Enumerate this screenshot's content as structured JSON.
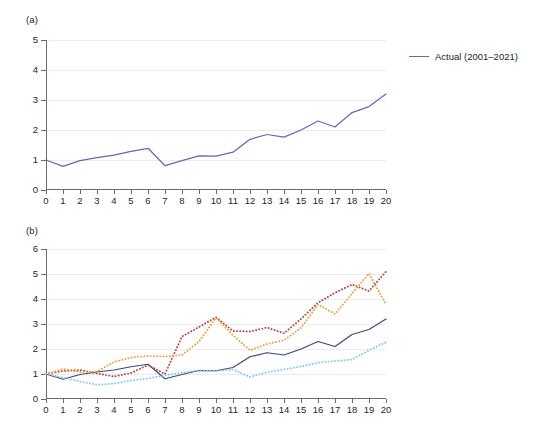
{
  "figure": {
    "panels": [
      {
        "id": "a",
        "label": "(a)",
        "ylim": [
          0,
          5
        ],
        "yticks": [
          "0",
          "1",
          "2",
          "3",
          "4",
          "5"
        ],
        "xticks": [
          "0",
          "1",
          "2",
          "3",
          "4",
          "5",
          "6",
          "7",
          "8",
          "9",
          "10",
          "11",
          "12",
          "13",
          "14",
          "15",
          "16",
          "17",
          "18",
          "19",
          "20"
        ],
        "legend": [
          {
            "name": "actual",
            "label": "Actual (2001–2021)",
            "color": "#5b6fae",
            "style": "solid"
          }
        ]
      },
      {
        "id": "b",
        "label": "(b)",
        "ylim": [
          0,
          6
        ],
        "yticks": [
          "0",
          "1",
          "2",
          "3",
          "4",
          "5",
          "6"
        ],
        "xticks": [
          "0",
          "1",
          "2",
          "3",
          "4",
          "5",
          "6",
          "7",
          "8",
          "9",
          "10",
          "11",
          "12",
          "13",
          "14",
          "15",
          "16",
          "17",
          "18",
          "19",
          "20"
        ],
        "legend": [
          {
            "name": "actual",
            "label": "Actual (2001–2021)",
            "color": "#3a4a7a",
            "style": "solid"
          },
          {
            "name": "sim-run-1",
            "label": "Sim Run 1",
            "color": "#b4453c",
            "style": "dotted"
          },
          {
            "name": "sim-run-2",
            "label": "Sim Run 2",
            "color": "#7ec8e8",
            "style": "dotted"
          },
          {
            "name": "sim-run-3",
            "label": "Sim Run 3",
            "color": "#e8a33d",
            "style": "dotted"
          }
        ]
      }
    ]
  },
  "chart_data": [
    {
      "type": "line",
      "title": "(a)",
      "xlabel": "",
      "ylabel": "",
      "xlim": [
        0,
        20
      ],
      "ylim": [
        0,
        5
      ],
      "grid": true,
      "legend_position": "right",
      "x": [
        0,
        1,
        2,
        3,
        4,
        5,
        6,
        7,
        8,
        9,
        10,
        11,
        12,
        13,
        14,
        15,
        16,
        17,
        18,
        19,
        20
      ],
      "series": [
        {
          "name": "Actual (2001–2021)",
          "color": "#5b6fae",
          "style": "solid",
          "values": [
            1.0,
            0.79,
            0.98,
            1.08,
            1.16,
            1.29,
            1.39,
            0.81,
            0.98,
            1.14,
            1.13,
            1.26,
            1.69,
            1.85,
            1.76,
            2.0,
            2.3,
            2.1,
            2.58,
            2.78,
            3.2
          ]
        }
      ]
    },
    {
      "type": "line",
      "title": "(b)",
      "xlabel": "",
      "ylabel": "",
      "xlim": [
        0,
        20
      ],
      "ylim": [
        0,
        6
      ],
      "grid": true,
      "legend_position": "right",
      "x": [
        0,
        1,
        2,
        3,
        4,
        5,
        6,
        7,
        8,
        9,
        10,
        11,
        12,
        13,
        14,
        15,
        16,
        17,
        18,
        19,
        20
      ],
      "series": [
        {
          "name": "Actual (2001–2021)",
          "color": "#3a4a7a",
          "style": "solid",
          "values": [
            1.0,
            0.79,
            0.98,
            1.08,
            1.16,
            1.29,
            1.39,
            0.81,
            0.98,
            1.14,
            1.13,
            1.26,
            1.69,
            1.85,
            1.76,
            2.0,
            2.3,
            2.1,
            2.58,
            2.78,
            3.2
          ]
        },
        {
          "name": "Sim Run 1",
          "color": "#b4453c",
          "style": "dotted",
          "values": [
            1.0,
            1.12,
            1.16,
            1.02,
            0.9,
            1.04,
            1.36,
            1.0,
            2.5,
            2.88,
            3.27,
            2.72,
            2.7,
            2.86,
            2.63,
            3.2,
            3.85,
            4.25,
            4.58,
            4.32,
            5.1
          ]
        },
        {
          "name": "Sim Run 2",
          "color": "#7ec8e8",
          "style": "dotted",
          "values": [
            1.0,
            0.86,
            0.7,
            0.57,
            0.62,
            0.74,
            0.82,
            0.95,
            1.05,
            1.15,
            1.12,
            1.18,
            0.88,
            1.07,
            1.18,
            1.3,
            1.45,
            1.52,
            1.58,
            1.95,
            2.27
          ]
        },
        {
          "name": "Sim Run 3",
          "color": "#e8a33d",
          "style": "dotted",
          "values": [
            1.0,
            1.2,
            1.08,
            1.1,
            1.48,
            1.66,
            1.72,
            1.7,
            1.76,
            2.3,
            3.25,
            2.55,
            1.95,
            2.2,
            2.35,
            2.85,
            3.78,
            3.4,
            4.22,
            5.02,
            3.78
          ]
        }
      ]
    }
  ]
}
